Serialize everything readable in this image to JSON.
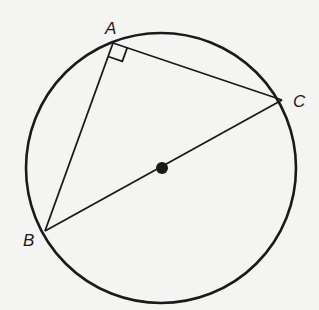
{
  "diagram": {
    "colors": {
      "background": "#f4f4f2",
      "stroke": "#1a1a1a"
    },
    "circle": {
      "cx": 161,
      "cy": 168,
      "r": 135
    },
    "points": {
      "A": {
        "label": "A",
        "x": 113,
        "y": 43
      },
      "B": {
        "label": "B",
        "x": 45,
        "y": 231
      },
      "C": {
        "label": "C",
        "x": 282,
        "y": 100
      },
      "O": {
        "label": "",
        "x": 162,
        "y": 168
      }
    },
    "right_angle_marker": {
      "at": "A",
      "size": 15
    },
    "labels": {
      "A": "A",
      "B": "B",
      "C": "C"
    }
  }
}
